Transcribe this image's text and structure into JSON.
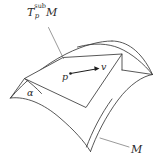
{
  "figure": {
    "name": "tangent-subspace-on-manifold",
    "background_color": "#ffffff",
    "line_color": "#3a3a3a",
    "labels": {
      "tangent_plane": {
        "base": "T",
        "superscript": "sub",
        "subscript": "p",
        "manifold": "M",
        "full_text": "T_p^sub M"
      },
      "angle": "α",
      "point": "p",
      "vector": "v",
      "manifold": "M"
    },
    "elements": {
      "surface_name": "saddle-surface",
      "plane_name": "tangent-plane-parallelogram",
      "vector_name": "tangent-vector-arrow",
      "point_name": "point-p-dot",
      "leader_plane_name": "leader-line-tangent-plane",
      "leader_manifold_name": "leader-line-manifold"
    }
  }
}
